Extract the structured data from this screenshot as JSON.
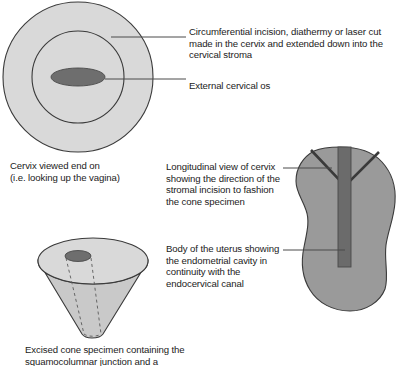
{
  "figure": {
    "colors": {
      "page_background": "#ffffff",
      "tissue_light": "#d9d9d9",
      "tissue_mid": "#9a9a9a",
      "os_dark": "#6e6e6e",
      "outline": "#3a3a3a",
      "leader_line": "#4a4a4a",
      "text": "#1b1b1b"
    },
    "labels": {
      "incision": "Circumferential incision, diathermy or laser cut made in the cervix and extended down into the cervical stroma",
      "external_os": "External cervical os",
      "cervix_end_on_caption": "Cervix viewed end on\n(i.e. looking up the vagina)",
      "longitudinal_view": "Longitudinal view of cervix showing the direction of the stromal incision to fashion the cone specimen",
      "uterus_body": "Body of the uterus showing the endometrial cavity in continuity with the endocervical canal",
      "cone_caption": "Excised cone specimen containing the\nsquamocolumnar junction and a"
    }
  }
}
